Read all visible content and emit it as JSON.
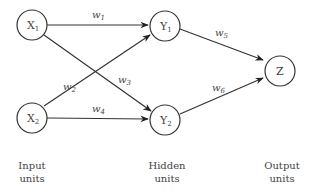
{
  "diagram": {
    "type": "neural-network",
    "nodes": [
      {
        "id": "X1",
        "label": "X",
        "sub": "1",
        "cx": 32,
        "cy": 25
      },
      {
        "id": "X2",
        "label": "X",
        "sub": "2",
        "cx": 32,
        "cy": 118
      },
      {
        "id": "Y1",
        "label": "Y",
        "sub": "1",
        "cx": 165,
        "cy": 26
      },
      {
        "id": "Y2",
        "label": "Y",
        "sub": "2",
        "cx": 165,
        "cy": 120
      },
      {
        "id": "Z",
        "label": "Z",
        "sub": "",
        "cx": 280,
        "cy": 71
      }
    ],
    "edges": [
      {
        "from": "X1",
        "to": "Y1",
        "weight": "w",
        "sub": "1"
      },
      {
        "from": "X2",
        "to": "Y1",
        "weight": "w",
        "sub": "2"
      },
      {
        "from": "X1",
        "to": "Y2",
        "weight": "w",
        "sub": "3"
      },
      {
        "from": "X2",
        "to": "Y2",
        "weight": "w",
        "sub": "4"
      },
      {
        "from": "Y1",
        "to": "Z",
        "weight": "w",
        "sub": "5"
      },
      {
        "from": "Y2",
        "to": "Z",
        "weight": "w",
        "sub": "6"
      }
    ],
    "layers": [
      {
        "line1": "Input",
        "line2": "units"
      },
      {
        "line1": "Hidden",
        "line2": "units"
      },
      {
        "line1": "Output",
        "line2": "units"
      }
    ]
  }
}
